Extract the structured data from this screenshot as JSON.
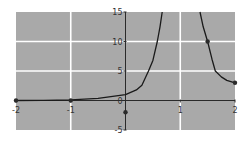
{
  "chart_data": {
    "type": "line",
    "title": "",
    "xlabel": "",
    "ylabel": "",
    "xlim": [
      -2,
      2
    ],
    "ylim": [
      -5,
      15
    ],
    "grid": true,
    "x_ticks": [
      -2,
      -1,
      1,
      2
    ],
    "x_tick_labels": [
      "-2",
      "-1",
      "1",
      "2"
    ],
    "y_ticks": [
      -5,
      0,
      5,
      10,
      15
    ],
    "y_tick_labels": [
      "-5",
      "0",
      "5",
      "10",
      "15"
    ],
    "vertical_asymptote_near": 1,
    "series": [
      {
        "name": "left-branch",
        "x": [
          -2,
          -1.5,
          -1,
          -0.5,
          0,
          0.2,
          0.3,
          0.42,
          0.5,
          0.58,
          0.63,
          0.67
        ],
        "y": [
          0,
          0.02,
          0.1,
          0.35,
          1,
          1.8,
          2.6,
          5,
          6.8,
          10,
          12.5,
          15
        ]
      },
      {
        "name": "right-branch",
        "x": [
          1.36,
          1.42,
          1.5,
          1.58,
          1.64,
          1.75,
          1.85,
          2
        ],
        "y": [
          15,
          12.5,
          10,
          7,
          5,
          4,
          3.4,
          3
        ]
      }
    ],
    "markers": [
      {
        "x": -2,
        "y": 0
      },
      {
        "x": -1,
        "y": 0
      },
      {
        "x": 0,
        "y": -2
      },
      {
        "x": 1.5,
        "y": 10
      },
      {
        "x": 2,
        "y": 3
      }
    ],
    "colors": {
      "background": "#a9a9a9",
      "grid": "#ffffff",
      "curve": "#1a1a1a",
      "axis": "#2a2a2a",
      "marker": "#2a2a2a"
    }
  }
}
